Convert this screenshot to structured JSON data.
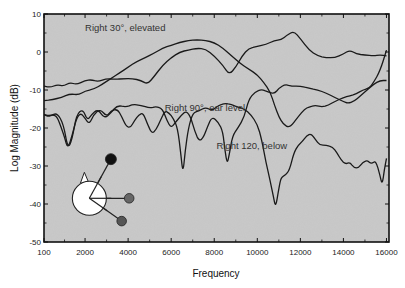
{
  "chart_data": {
    "type": "line",
    "title": "",
    "xlabel": "Frequency",
    "ylabel": "Log Magnitude (dB)",
    "xlim": [
      0,
      16000
    ],
    "ylim": [
      -50,
      10
    ],
    "x_ticks": [
      {
        "value": 100,
        "label": "100"
      },
      {
        "value": 2000,
        "label": "2000"
      },
      {
        "value": 4000,
        "label": "4000"
      },
      {
        "value": 6000,
        "label": "6000"
      },
      {
        "value": 8000,
        "label": "8000"
      },
      {
        "value": 10000,
        "label": "10000"
      },
      {
        "value": 12000,
        "label": "12000"
      },
      {
        "value": 14000,
        "label": "14000"
      },
      {
        "value": 16000,
        "label": "16000"
      }
    ],
    "y_ticks": [
      {
        "value": 10,
        "label": "10"
      },
      {
        "value": 0,
        "label": "0"
      },
      {
        "value": -10,
        "label": "-10"
      },
      {
        "value": -20,
        "label": "-20"
      },
      {
        "value": -30,
        "label": "-30"
      },
      {
        "value": -40,
        "label": "-40"
      },
      {
        "value": -50,
        "label": "-50"
      }
    ],
    "grid": false,
    "legend": "none (inline annotations)",
    "series": [
      {
        "name": "Right 30°, elevated",
        "annotation": {
          "text": "Right 30°, elevated",
          "x": 2000,
          "y": 5.5
        },
        "points": [
          [
            100,
            -12.8
          ],
          [
            500,
            -12.5
          ],
          [
            900,
            -12.0
          ],
          [
            1300,
            -11.0
          ],
          [
            1700,
            -11.3
          ],
          [
            2000,
            -10.3
          ],
          [
            2400,
            -9.8
          ],
          [
            2800,
            -8.5
          ],
          [
            3200,
            -7.0
          ],
          [
            3600,
            -5.5
          ],
          [
            4000,
            -4.0
          ],
          [
            4400,
            -2.5
          ],
          [
            4800,
            -1.5
          ],
          [
            5200,
            -0.3
          ],
          [
            5600,
            1.0
          ],
          [
            6000,
            1.8
          ],
          [
            6400,
            2.5
          ],
          [
            6800,
            3.0
          ],
          [
            7200,
            3.2
          ],
          [
            7600,
            3.0
          ],
          [
            8000,
            2.5
          ],
          [
            8400,
            1.0
          ],
          [
            8800,
            -1.0
          ],
          [
            9200,
            -3.0
          ],
          [
            9600,
            -4.5
          ],
          [
            10000,
            -6.0
          ],
          [
            10300,
            -8.0
          ],
          [
            10600,
            -10.5
          ],
          [
            10800,
            -14.0
          ],
          [
            11000,
            -17.0
          ],
          [
            11200,
            -19.0
          ],
          [
            11500,
            -20.0
          ],
          [
            11900,
            -17.0
          ],
          [
            12200,
            -15.0
          ],
          [
            12400,
            -14.5
          ],
          [
            12700,
            -14.0
          ],
          [
            13000,
            -14.5
          ],
          [
            13300,
            -14.0
          ],
          [
            13600,
            -13.0
          ],
          [
            14000,
            -12.0
          ],
          [
            14300,
            -11.5
          ],
          [
            14600,
            -11.0
          ],
          [
            14900,
            -10.0
          ],
          [
            15200,
            -9.5
          ],
          [
            15400,
            -8.0
          ],
          [
            15700,
            -5.0
          ],
          [
            16000,
            0.5
          ]
        ]
      },
      {
        "name": "Right 90°, ear level",
        "annotation": {
          "text": "Right 90°, ear level",
          "x": 5700,
          "y": -15.5
        },
        "points": [
          [
            100,
            -9.0
          ],
          [
            400,
            -9.3
          ],
          [
            700,
            -8.6
          ],
          [
            1000,
            -9.0
          ],
          [
            1300,
            -8.0
          ],
          [
            1600,
            -8.6
          ],
          [
            2000,
            -7.5
          ],
          [
            2300,
            -7.3
          ],
          [
            2600,
            -7.8
          ],
          [
            3000,
            -7.0
          ],
          [
            3400,
            -7.2
          ],
          [
            3800,
            -7.0
          ],
          [
            4200,
            -7.0
          ],
          [
            4600,
            -7.5
          ],
          [
            4900,
            -8.5
          ],
          [
            5200,
            -6.5
          ],
          [
            5600,
            -3.5
          ],
          [
            6000,
            -1.5
          ],
          [
            6400,
            0.0
          ],
          [
            6800,
            0.5
          ],
          [
            7200,
            1.0
          ],
          [
            7600,
            0.8
          ],
          [
            8000,
            -1.0
          ],
          [
            8400,
            -3.5
          ],
          [
            8700,
            -6.0
          ],
          [
            9000,
            -4.0
          ],
          [
            9300,
            -1.0
          ],
          [
            9600,
            1.0
          ],
          [
            10000,
            1.5
          ],
          [
            10400,
            2.0
          ],
          [
            10800,
            3.0
          ],
          [
            11100,
            3.2
          ],
          [
            11400,
            4.5
          ],
          [
            11700,
            5.5
          ],
          [
            12000,
            3.5
          ],
          [
            12400,
            0.5
          ],
          [
            12800,
            -1.0
          ],
          [
            13200,
            -1.5
          ],
          [
            13600,
            -1.5
          ],
          [
            14000,
            -0.5
          ],
          [
            14300,
            0.5
          ],
          [
            14600,
            -0.5
          ],
          [
            15000,
            -0.8
          ],
          [
            15400,
            -1.0
          ],
          [
            15700,
            -0.8
          ],
          [
            16000,
            -1.0
          ]
        ]
      },
      {
        "name": "Right 120, below",
        "annotation": {
          "text": "Right 120, below",
          "x": 8100,
          "y": -25.5
        },
        "points": [
          [
            100,
            -16.5
          ],
          [
            400,
            -16.8
          ],
          [
            700,
            -16.0
          ],
          [
            1000,
            -19.0
          ],
          [
            1200,
            -25.5
          ],
          [
            1400,
            -23.0
          ],
          [
            1600,
            -16.5
          ],
          [
            1900,
            -15.0
          ],
          [
            2100,
            -18.0
          ],
          [
            2300,
            -16.5
          ],
          [
            2600,
            -15.0
          ],
          [
            2900,
            -17.5
          ],
          [
            3200,
            -16.0
          ],
          [
            3500,
            -14.0
          ],
          [
            3900,
            -14.5
          ],
          [
            4200,
            -13.8
          ],
          [
            4600,
            -14.0
          ],
          [
            5000,
            -14.8
          ],
          [
            5300,
            -14.3
          ],
          [
            5600,
            -15.0
          ],
          [
            5800,
            -18.0
          ],
          [
            6000,
            -20.0
          ],
          [
            6200,
            -18.5
          ],
          [
            6500,
            -16.5
          ],
          [
            6700,
            -15.5
          ],
          [
            6900,
            -17.0
          ],
          [
            7100,
            -21.0
          ],
          [
            7300,
            -23.5
          ],
          [
            7500,
            -22.5
          ],
          [
            7700,
            -19.5
          ],
          [
            7900,
            -17.0
          ],
          [
            8200,
            -18.5
          ],
          [
            8400,
            -21.0
          ],
          [
            8500,
            -26.0
          ],
          [
            8600,
            -29.5
          ],
          [
            8700,
            -27.0
          ],
          [
            8850,
            -22.0
          ],
          [
            9100,
            -20.0
          ],
          [
            9400,
            -17.0
          ],
          [
            9600,
            -12.5
          ],
          [
            9900,
            -10.5
          ],
          [
            10200,
            -9.8
          ],
          [
            10500,
            -10.5
          ],
          [
            10800,
            -11.0
          ],
          [
            11000,
            -9.5
          ],
          [
            11300,
            -8.5
          ],
          [
            11600,
            -9.0
          ],
          [
            12000,
            -9.0
          ],
          [
            12400,
            -9.5
          ],
          [
            12800,
            -10.0
          ],
          [
            13200,
            -10.8
          ],
          [
            13600,
            -12.0
          ],
          [
            14000,
            -13.0
          ],
          [
            14200,
            -13.5
          ],
          [
            14500,
            -13.0
          ],
          [
            14800,
            -11.5
          ],
          [
            15100,
            -10.0
          ],
          [
            15400,
            -8.5
          ],
          [
            15700,
            -7.5
          ],
          [
            16000,
            -7.5
          ]
        ]
      },
      {
        "name": "Right 120, below (low curve)",
        "points": [
          [
            100,
            -16.5
          ],
          [
            300,
            -17.0
          ],
          [
            500,
            -16.5
          ],
          [
            700,
            -17.0
          ],
          [
            900,
            -20.0
          ],
          [
            1050,
            -22.5
          ],
          [
            1200,
            -25.5
          ],
          [
            1400,
            -22.0
          ],
          [
            1600,
            -17.5
          ],
          [
            1800,
            -16.0
          ],
          [
            2000,
            -17.5
          ],
          [
            2200,
            -19.0
          ],
          [
            2400,
            -16.5
          ],
          [
            2700,
            -15.0
          ],
          [
            3000,
            -17.0
          ],
          [
            3200,
            -15.5
          ],
          [
            3500,
            -15.0
          ],
          [
            3700,
            -17.0
          ],
          [
            3900,
            -19.5
          ],
          [
            4100,
            -20.0
          ],
          [
            4300,
            -18.0
          ],
          [
            4500,
            -16.5
          ],
          [
            4700,
            -16.0
          ],
          [
            4900,
            -19.0
          ],
          [
            5100,
            -21.5
          ],
          [
            5300,
            -20.5
          ],
          [
            5500,
            -18.0
          ],
          [
            5700,
            -15.5
          ],
          [
            5900,
            -16.0
          ],
          [
            6100,
            -17.5
          ],
          [
            6300,
            -20.0
          ],
          [
            6450,
            -27.0
          ],
          [
            6550,
            -32.0
          ],
          [
            6650,
            -26.0
          ],
          [
            6800,
            -20.0
          ],
          [
            7000,
            -16.0
          ],
          [
            7300,
            -15.5
          ],
          [
            7600,
            -14.5
          ],
          [
            7900,
            -15.5
          ],
          [
            8200,
            -14.0
          ],
          [
            8500,
            -13.5
          ],
          [
            8800,
            -13.8
          ],
          [
            9100,
            -14.5
          ],
          [
            9400,
            -15.0
          ],
          [
            9700,
            -16.5
          ],
          [
            10000,
            -19.0
          ],
          [
            10200,
            -23.0
          ],
          [
            10400,
            -29.0
          ],
          [
            10600,
            -34.0
          ],
          [
            10750,
            -38.0
          ],
          [
            10850,
            -41.0
          ],
          [
            11000,
            -36.0
          ],
          [
            11100,
            -33.0
          ],
          [
            11300,
            -32.5
          ],
          [
            11500,
            -31.0
          ],
          [
            11700,
            -26.5
          ],
          [
            11900,
            -24.5
          ],
          [
            12100,
            -23.5
          ],
          [
            12300,
            -22.0
          ],
          [
            12500,
            -21.5
          ],
          [
            12700,
            -23.0
          ],
          [
            12900,
            -24.5
          ],
          [
            13200,
            -24.5
          ],
          [
            13500,
            -25.0
          ],
          [
            13700,
            -26.5
          ],
          [
            13900,
            -28.5
          ],
          [
            14100,
            -29.5
          ],
          [
            14300,
            -29.0
          ],
          [
            14500,
            -30.5
          ],
          [
            14700,
            -30.5
          ],
          [
            14900,
            -29.0
          ],
          [
            15100,
            -28.5
          ],
          [
            15300,
            -29.5
          ],
          [
            15500,
            -28.5
          ],
          [
            15700,
            -32.5
          ],
          [
            15800,
            -35.0
          ],
          [
            15900,
            -31.0
          ],
          [
            16000,
            -28.0
          ]
        ]
      }
    ],
    "annotations": [
      {
        "text": "Right 30°, elevated",
        "x": 2000,
        "y": 5.5
      },
      {
        "text": "Right 90°, ear level",
        "x": 5700,
        "y": -15.5
      },
      {
        "text": "Right 120, below",
        "x": 8100,
        "y": -25.5
      }
    ],
    "inset": {
      "description": "head diagram (top view) with three source positions",
      "head": {
        "cx": 2200,
        "cy": -38.5,
        "r_px": 17,
        "fill": "#ffffff"
      },
      "sources": [
        {
          "label": "30° elevated",
          "x": 3200,
          "y": -28.2,
          "fill": "#111111"
        },
        {
          "label": "90° ear level",
          "x": 4050,
          "y": -38.5,
          "fill": "#666666"
        },
        {
          "label": "120° below",
          "x": 3700,
          "y": -44.5,
          "fill": "#555555"
        }
      ]
    }
  },
  "colors": {
    "plot_background": "#c9c9c9",
    "line": "#1a1a1a",
    "axis": "#111111",
    "page_background": "#ffffff"
  }
}
